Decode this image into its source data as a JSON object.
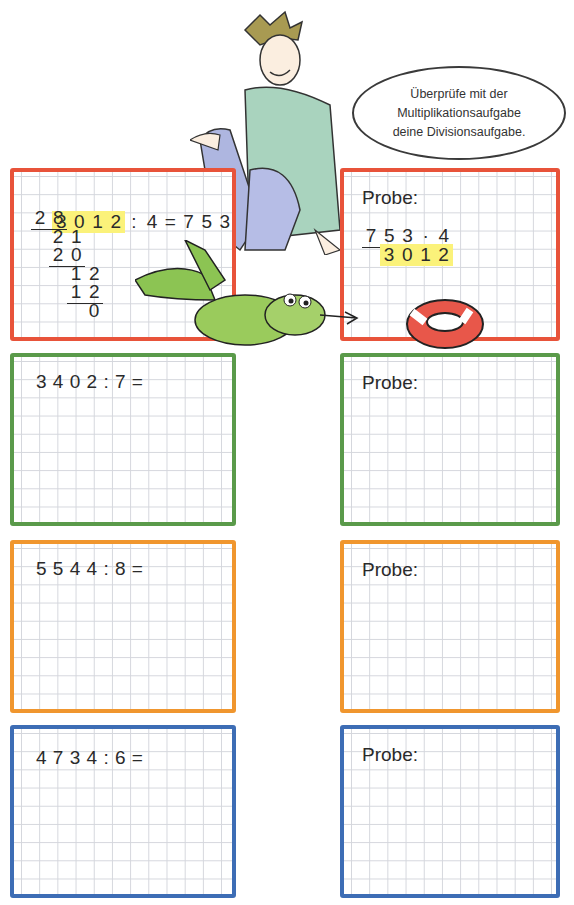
{
  "header": {
    "cut_text": "... passende Aufgabe ..."
  },
  "speech_bubble": {
    "lines": [
      "Überprüfe mit der",
      "Multiplikationsaufgabe",
      "deine Divisionsaufgabe."
    ]
  },
  "example": {
    "division": {
      "dividend": [
        "3",
        "0",
        "1",
        "2"
      ],
      "operator": ":",
      "divisor": "4",
      "equals": "=",
      "result": [
        "7",
        "5",
        "3"
      ],
      "steps": [
        {
          "digits": [
            "2",
            "8"
          ],
          "underlined": true
        },
        {
          "digits": [
            "2",
            "1"
          ],
          "underlined": false
        },
        {
          "digits": [
            "2",
            "0"
          ],
          "underlined": true
        },
        {
          "digits": [
            "1",
            "2"
          ],
          "underlined": false
        },
        {
          "digits": [
            "1",
            "2"
          ],
          "underlined": true
        },
        {
          "digits": [
            "0"
          ],
          "underlined": false
        }
      ]
    },
    "probe": {
      "label": "Probe:",
      "factor_digits": [
        "7",
        "5",
        "3"
      ],
      "dot": "·",
      "multiplier": "4",
      "product": [
        "3",
        "0",
        "1",
        "2"
      ]
    }
  },
  "tasks": [
    {
      "expression": "3 4 0 2 : 7 =",
      "color": "#5a9a4a",
      "probe_label": "Probe:"
    },
    {
      "expression": "5 5 4 4 : 8 =",
      "color": "#f0962e",
      "probe_label": "Probe:"
    },
    {
      "expression": "4 7 3 4 : 6 =",
      "color": "#3d6db5",
      "probe_label": "Probe:"
    }
  ],
  "colors": {
    "red": "#e8533a",
    "green": "#5a9a4a",
    "orange": "#f0962e",
    "blue": "#3d6db5",
    "highlight": "#fbf27a"
  }
}
